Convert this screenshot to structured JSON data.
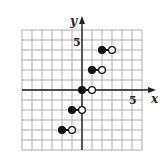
{
  "chart_data": {
    "type": "scatter",
    "title": "",
    "xlabel": "x",
    "ylabel": "y",
    "xlim": [
      -6,
      6
    ],
    "ylim": [
      -6,
      6
    ],
    "grid": true,
    "tick_labels": {
      "x": [
        "5"
      ],
      "y": [
        "5"
      ]
    },
    "series": [
      {
        "name": "step segments",
        "segments": [
          {
            "x_start": -2,
            "x_end": -1,
            "y": -4,
            "start": "closed",
            "end": "open"
          },
          {
            "x_start": -1,
            "x_end": 0,
            "y": -2,
            "start": "closed",
            "end": "open"
          },
          {
            "x_start": 0,
            "x_end": 1,
            "y": 0,
            "start": "closed",
            "end": "open"
          },
          {
            "x_start": 1,
            "x_end": 2,
            "y": 2,
            "start": "closed",
            "end": "open"
          },
          {
            "x_start": 2,
            "x_end": 3,
            "y": 4,
            "start": "closed",
            "end": "open"
          }
        ]
      }
    ]
  },
  "labels": {
    "x_axis": "x",
    "y_axis": "y",
    "x_tick": "5",
    "y_tick": "5"
  }
}
